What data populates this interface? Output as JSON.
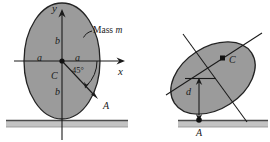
{
  "figure": {
    "background": "#ffffff",
    "body_fill": "#9b9b9b",
    "body_stroke": "#1f1f1f",
    "line_color": "#1a1a1a",
    "ground_fill": "#bdbdbd",
    "ground_stroke": "#555555"
  },
  "left_diagram": {
    "name": "ellipse-upright-with-axes",
    "axis_y_label": "y",
    "axis_x_label": "x",
    "mass_label": "Mass m",
    "mass_label_prefix": "Mass ",
    "mass_label_symbol": "m",
    "semi_axis_horizontal_left": "a",
    "semi_axis_horizontal_right": "a",
    "semi_axis_vertical_top": "b",
    "semi_axis_vertical_bottom": "b",
    "center_label": "C",
    "angle_label": "45°",
    "contact_point_label": "A"
  },
  "right_diagram": {
    "name": "ellipse-tilted-resting-on-ground",
    "center_label": "C",
    "distance_label": "d",
    "contact_point_label": "A"
  }
}
